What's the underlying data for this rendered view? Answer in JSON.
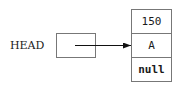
{
  "diagram": {
    "type": "linked-list",
    "head_label": "HEAD",
    "nodes": [
      {
        "fields": [
          "150",
          "A",
          "null"
        ]
      }
    ],
    "colors": {
      "stroke": "#777777",
      "arrow": "#111111",
      "text": "#1a1a1a",
      "background": "#ffffff"
    }
  }
}
